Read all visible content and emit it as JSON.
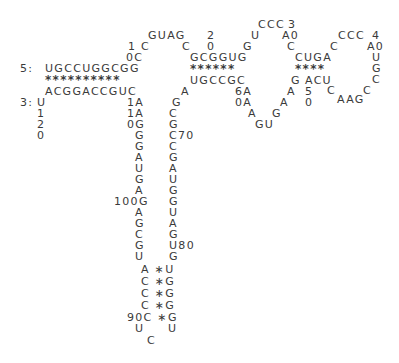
{
  "diagram": {
    "type": "rna-secondary-structure",
    "labels": [
      {
        "id": "five-prime-label",
        "text": "5:",
        "x": 20,
        "y": 63
      },
      {
        "id": "three-prime-label",
        "text": "3:",
        "x": 20,
        "y": 97
      },
      {
        "id": "stem1-top",
        "text": "UGCCUGGCGG",
        "x": 45,
        "y": 63
      },
      {
        "id": "stem1-pairs",
        "text": "**********",
        "x": 45,
        "y": 75,
        "star": true
      },
      {
        "id": "stem1-bottom",
        "text": "ACGGACCGUC",
        "x": 45,
        "y": 86
      },
      {
        "id": "tail-u",
        "text": "U",
        "x": 37,
        "y": 97
      },
      {
        "id": "tail-1",
        "text": "1",
        "x": 37,
        "y": 108
      },
      {
        "id": "tail-2",
        "text": "2",
        "x": 37,
        "y": 119
      },
      {
        "id": "tail-0",
        "text": "0",
        "x": 37,
        "y": 130
      },
      {
        "id": "num10-1",
        "text": "1",
        "x": 128,
        "y": 41
      },
      {
        "id": "loop-c1",
        "text": "C",
        "x": 141,
        "y": 41
      },
      {
        "id": "num10-0c",
        "text": "0C",
        "x": 126,
        "y": 52
      },
      {
        "id": "loop-guag",
        "text": "GUAG",
        "x": 148,
        "y": 30
      },
      {
        "id": "loop-c2",
        "text": "C",
        "x": 182,
        "y": 41
      },
      {
        "id": "num20-2",
        "text": "2",
        "x": 207,
        "y": 30
      },
      {
        "id": "num20-0",
        "text": "0",
        "x": 207,
        "y": 41
      },
      {
        "id": "stem2-top",
        "text": "GCGGUG",
        "x": 190,
        "y": 52
      },
      {
        "id": "stem2-pairs",
        "text": "******",
        "x": 190,
        "y": 64,
        "star": true
      },
      {
        "id": "stem2-bottom",
        "text": "UGCCGC",
        "x": 190,
        "y": 75
      },
      {
        "id": "a-left",
        "text": "A",
        "x": 181,
        "y": 86
      },
      {
        "id": "loop2-g",
        "text": "G",
        "x": 243,
        "y": 41
      },
      {
        "id": "loop2-u",
        "text": "U",
        "x": 251,
        "y": 30
      },
      {
        "id": "loop2-ccc",
        "text": "CCC",
        "x": 258,
        "y": 19
      },
      {
        "id": "num30-3",
        "text": "3",
        "x": 288,
        "y": 19
      },
      {
        "id": "num30-a0",
        "text": "A0",
        "x": 282,
        "y": 30
      },
      {
        "id": "loop2-c",
        "text": "C",
        "x": 287,
        "y": 41
      },
      {
        "id": "stem3-top",
        "text": "CUGA",
        "x": 295,
        "y": 52
      },
      {
        "id": "stem3-pairs",
        "text": "****",
        "x": 295,
        "y": 64,
        "star": true
      },
      {
        "id": "stem3-bottom-g",
        "text": "G",
        "x": 291,
        "y": 75
      },
      {
        "id": "stem3-bottom",
        "text": "ACU",
        "x": 305,
        "y": 75
      },
      {
        "id": "num50-5",
        "text": "5",
        "x": 305,
        "y": 86
      },
      {
        "id": "num50-0",
        "text": "0",
        "x": 305,
        "y": 97
      },
      {
        "id": "loop3-c1",
        "text": "C",
        "x": 330,
        "y": 41
      },
      {
        "id": "loop3-ccc",
        "text": "CCC",
        "x": 338,
        "y": 30
      },
      {
        "id": "num40-4",
        "text": "4",
        "x": 372,
        "y": 30
      },
      {
        "id": "num40-a0",
        "text": "A0",
        "x": 367,
        "y": 41
      },
      {
        "id": "loop3-u",
        "text": "U",
        "x": 372,
        "y": 52
      },
      {
        "id": "loop3-g",
        "text": "G",
        "x": 372,
        "y": 63
      },
      {
        "id": "loop3-c2",
        "text": "C",
        "x": 372,
        "y": 74
      },
      {
        "id": "loop3-c3",
        "text": "C",
        "x": 363,
        "y": 85
      },
      {
        "id": "loop3-aag",
        "text": "AAG",
        "x": 337,
        "y": 94
      },
      {
        "id": "loop3-c4",
        "text": "C",
        "x": 327,
        "y": 85
      },
      {
        "id": "int-6a",
        "text": "6A",
        "x": 235,
        "y": 86
      },
      {
        "id": "int-0a",
        "text": "0A",
        "x": 235,
        "y": 97
      },
      {
        "id": "int-a1",
        "text": "A",
        "x": 248,
        "y": 108
      },
      {
        "id": "int-gu",
        "text": "GU",
        "x": 255,
        "y": 119
      },
      {
        "id": "int-g",
        "text": "G",
        "x": 272,
        "y": 108
      },
      {
        "id": "int-a2",
        "text": "A",
        "x": 280,
        "y": 97
      },
      {
        "id": "int-a3",
        "text": "A",
        "x": 287,
        "y": 86
      },
      {
        "id": "left-1a-1",
        "text": "1A",
        "x": 127,
        "y": 97
      },
      {
        "id": "left-1a-2",
        "text": "1A",
        "x": 127,
        "y": 108
      },
      {
        "id": "left-0g",
        "text": "0G",
        "x": 127,
        "y": 119
      },
      {
        "id": "left-g1",
        "text": "G",
        "x": 135,
        "y": 130
      },
      {
        "id": "left-g2",
        "text": "G",
        "x": 135,
        "y": 141
      },
      {
        "id": "left-a1",
        "text": "A",
        "x": 135,
        "y": 152
      },
      {
        "id": "left-u1",
        "text": "U",
        "x": 135,
        "y": 163
      },
      {
        "id": "left-g3",
        "text": "G",
        "x": 135,
        "y": 174
      },
      {
        "id": "left-a2",
        "text": "A",
        "x": 135,
        "y": 185
      },
      {
        "id": "left-100g",
        "text": "100G",
        "x": 114,
        "y": 196
      },
      {
        "id": "left-a3",
        "text": "A",
        "x": 135,
        "y": 207
      },
      {
        "id": "left-g4",
        "text": "G",
        "x": 135,
        "y": 218
      },
      {
        "id": "left-c1",
        "text": "C",
        "x": 135,
        "y": 229
      },
      {
        "id": "left-g5",
        "text": "G",
        "x": 135,
        "y": 240
      },
      {
        "id": "left-u2",
        "text": "U",
        "x": 135,
        "y": 251
      },
      {
        "id": "right-g1",
        "text": "G",
        "x": 172,
        "y": 97
      },
      {
        "id": "right-c1",
        "text": "C",
        "x": 169,
        "y": 108
      },
      {
        "id": "right-g2",
        "text": "G",
        "x": 169,
        "y": 119
      },
      {
        "id": "right-c70",
        "text": "C70",
        "x": 169,
        "y": 130
      },
      {
        "id": "right-c2",
        "text": "C",
        "x": 169,
        "y": 141
      },
      {
        "id": "right-g3",
        "text": "G",
        "x": 169,
        "y": 152
      },
      {
        "id": "right-a1",
        "text": "A",
        "x": 169,
        "y": 163
      },
      {
        "id": "right-u1",
        "text": "U",
        "x": 169,
        "y": 174
      },
      {
        "id": "right-g4",
        "text": "G",
        "x": 169,
        "y": 185
      },
      {
        "id": "right-g5",
        "text": "G",
        "x": 169,
        "y": 196
      },
      {
        "id": "right-u2",
        "text": "U",
        "x": 169,
        "y": 207
      },
      {
        "id": "right-a2",
        "text": "A",
        "x": 169,
        "y": 218
      },
      {
        "id": "right-g6",
        "text": "G",
        "x": 169,
        "y": 229
      },
      {
        "id": "right-u80",
        "text": "U80",
        "x": 169,
        "y": 240
      },
      {
        "id": "right-g7",
        "text": "G",
        "x": 169,
        "y": 251
      },
      {
        "id": "stem4-row1",
        "text": "A ∗U",
        "x": 141,
        "y": 264
      },
      {
        "id": "stem4-row2",
        "text": "C ∗G",
        "x": 141,
        "y": 276
      },
      {
        "id": "stem4-row3",
        "text": "C ∗G",
        "x": 141,
        "y": 288
      },
      {
        "id": "stem4-row4",
        "text": "C ∗G",
        "x": 141,
        "y": 300
      },
      {
        "id": "stem4-row5",
        "text": "90C ∗G",
        "x": 127,
        "y": 312
      },
      {
        "id": "hairpin-u1",
        "text": "U",
        "x": 135,
        "y": 323
      },
      {
        "id": "hairpin-u2",
        "text": "U",
        "x": 168,
        "y": 323
      },
      {
        "id": "hairpin-c",
        "text": "C",
        "x": 147,
        "y": 335
      }
    ]
  }
}
